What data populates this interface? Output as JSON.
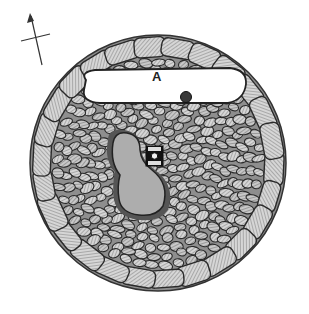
{
  "figure": {
    "type": "archaeological-plan",
    "labels": [
      {
        "text": "A",
        "x": 156,
        "y": 77
      }
    ],
    "north_arrow": {
      "present": true,
      "x1": 42,
      "y1": 65,
      "x2": 31,
      "y2": 15
    },
    "colors": {
      "background": "#ffffff",
      "outline": "#2a2a2a",
      "stone_fill": "#cfcfcf",
      "hatch": "#6a6a6a",
      "inner_pit": "#bdbdbd",
      "chamber_A": "#ffffff"
    },
    "features": [
      "outer ring of large kerb stones",
      "rubble infill of small cobbles",
      "white elongated chamber A with dark round post-hole",
      "central grey kidney-shaped pit",
      "small square setting with circle beside pit"
    ]
  }
}
